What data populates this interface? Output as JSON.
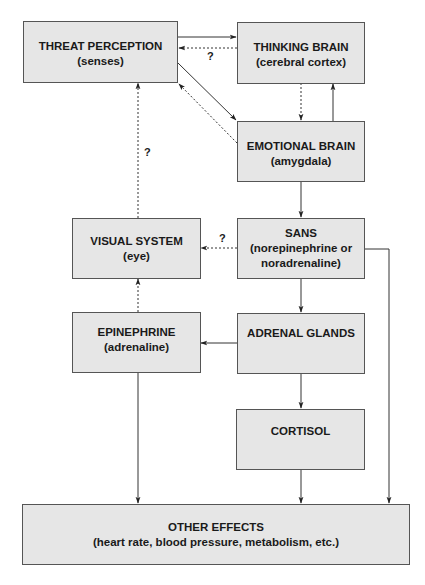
{
  "diagram": {
    "nodes": [
      {
        "id": "threat",
        "title": "THREAT PERCEPTION",
        "sub": "(senses)"
      },
      {
        "id": "thinking",
        "title": "THINKING BRAIN",
        "sub": "(cerebral cortex)"
      },
      {
        "id": "emotional",
        "title": "EMOTIONAL BRAIN",
        "sub": "(amygdala)"
      },
      {
        "id": "visual",
        "title": "VISUAL SYSTEM",
        "sub": "(eye)"
      },
      {
        "id": "sans",
        "title": "SANS",
        "sub": "(norepinephrine or noradrenaline)"
      },
      {
        "id": "epinephrine",
        "title": "EPINEPHRINE",
        "sub": "(adrenaline)"
      },
      {
        "id": "adrenal",
        "title": "ADRENAL GLANDS",
        "sub": ""
      },
      {
        "id": "cortisol",
        "title": "CORTISOL",
        "sub": ""
      },
      {
        "id": "other",
        "title": "OTHER EFFECTS",
        "sub": "(heart rate, blood pressure, metabolism, etc.)"
      }
    ],
    "edges": [
      {
        "from": "threat",
        "to": "thinking",
        "style": "solid"
      },
      {
        "from": "thinking",
        "to": "threat",
        "style": "dashed",
        "label": "?"
      },
      {
        "from": "threat",
        "to": "emotional",
        "style": "solid"
      },
      {
        "from": "emotional",
        "to": "threat",
        "style": "dashed"
      },
      {
        "from": "thinking",
        "to": "emotional",
        "style": "dashed"
      },
      {
        "from": "emotional",
        "to": "thinking",
        "style": "solid"
      },
      {
        "from": "visual",
        "to": "threat",
        "style": "dashed",
        "label": "?"
      },
      {
        "from": "emotional",
        "to": "sans",
        "style": "solid"
      },
      {
        "from": "sans",
        "to": "visual",
        "style": "dashed",
        "label": "?"
      },
      {
        "from": "sans",
        "to": "adrenal",
        "style": "solid"
      },
      {
        "from": "adrenal",
        "to": "epinephrine",
        "style": "solid"
      },
      {
        "from": "epinephrine",
        "to": "visual",
        "style": "dashed"
      },
      {
        "from": "adrenal",
        "to": "cortisol",
        "style": "solid"
      },
      {
        "from": "epinephrine",
        "to": "other",
        "style": "solid"
      },
      {
        "from": "cortisol",
        "to": "other",
        "style": "solid"
      },
      {
        "from": "sans",
        "to": "other",
        "style": "solid"
      }
    ],
    "question_mark": "?"
  }
}
